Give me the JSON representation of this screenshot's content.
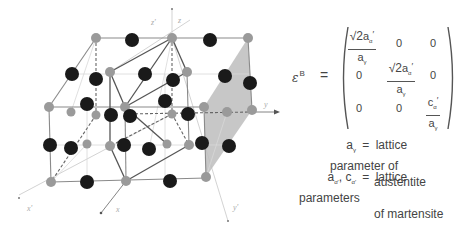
{
  "diagram": {
    "type": "crystal-lattice-bain-correspondence",
    "axes": {
      "z_prime": "z'",
      "z": "z",
      "y": "y",
      "x_prime": "x'",
      "x": "x",
      "y_prime": "y'"
    },
    "colors": {
      "gray_atom": "#9a9a9a",
      "black_atom": "#1a1a1a",
      "line": "#7a7a7a",
      "light_line": "#cfcfcf",
      "plane_fill": "#bdbdbd"
    }
  },
  "equation": {
    "lhs_symbol": "ε",
    "lhs_superscript": "B",
    "equals": "=",
    "matrix": [
      [
        {
          "type": "frac",
          "num_sqrt": "√2",
          "num_var": "a",
          "num_sub": "α",
          "num_prime": "′",
          "den_var": "a",
          "den_sub": "γ"
        },
        {
          "type": "value",
          "text": "0"
        },
        {
          "type": "value",
          "text": "0"
        }
      ],
      [
        {
          "type": "value",
          "text": "0"
        },
        {
          "type": "frac",
          "num_sqrt": "√2",
          "num_var": "a",
          "num_sub": "α",
          "num_prime": "′",
          "den_var": "a",
          "den_sub": "γ"
        },
        {
          "type": "value",
          "text": "0"
        }
      ],
      [
        {
          "type": "value",
          "text": "0"
        },
        {
          "type": "value",
          "text": "0"
        },
        {
          "type": "frac",
          "num_sqrt": "",
          "num_var": "c",
          "num_sub": "α",
          "num_prime": "′",
          "den_var": "a",
          "den_sub": "γ"
        }
      ]
    ]
  },
  "legend": [
    {
      "symbol_var": "a",
      "symbol_sub": "γ",
      "equals": "=",
      "line1": "lattice parameter of",
      "line2": "austentite"
    },
    {
      "symbol_var": "a",
      "symbol_sub": "α′",
      "symbol_var2": "c",
      "symbol_sub2": "α′",
      "separator": ",",
      "equals": "=",
      "line1": "lattice parameters",
      "line2": "of martensite"
    }
  ]
}
